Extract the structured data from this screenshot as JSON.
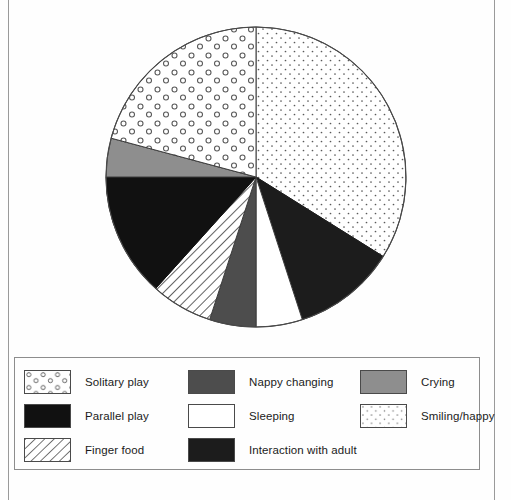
{
  "page": {
    "background": "#fefefe",
    "rule_color": "#9a9a9a"
  },
  "chart_data": {
    "type": "pie",
    "title": "",
    "subtitle": "",
    "xlabel": "",
    "ylabel": "",
    "legend_position": "bottom",
    "grid": false,
    "units": "proportion of observations",
    "start_angle_deg": 0,
    "direction": "clockwise",
    "categories": [
      "Smiling/happy",
      "Interaction with adult",
      "Sleeping",
      "Nappy changing",
      "Finger food",
      "Parallel play",
      "Crying",
      "Solitary play"
    ],
    "values": [
      33.9,
      11.1,
      5.0,
      5.0,
      6.7,
      13.3,
      4.2,
      20.8
    ],
    "slices": [
      {
        "label": "Smiling/happy",
        "value": 33.9,
        "start_deg": 0,
        "end_deg": 122,
        "fill": "#ffffff",
        "pattern": "fine-dots",
        "pattern_color": "#5a5a5a",
        "stroke": "#3c3c3c"
      },
      {
        "label": "Interaction with adult",
        "value": 11.1,
        "start_deg": 122,
        "end_deg": 162,
        "fill": "#1c1c1c",
        "pattern": "solid",
        "pattern_color": "#1c1c1c",
        "stroke": "#1c1c1c"
      },
      {
        "label": "Sleeping",
        "value": 5.0,
        "start_deg": 162,
        "end_deg": 180,
        "fill": "#ffffff",
        "pattern": "solid",
        "pattern_color": "#ffffff",
        "stroke": "#3c3c3c"
      },
      {
        "label": "Nappy changing",
        "value": 5.0,
        "start_deg": 180,
        "end_deg": 198,
        "fill": "#4d4d4d",
        "pattern": "solid",
        "pattern_color": "#4d4d4d",
        "stroke": "#3c3c3c"
      },
      {
        "label": "Finger food",
        "value": 6.7,
        "start_deg": 198,
        "end_deg": 222,
        "fill": "#ffffff",
        "pattern": "diagonal-hatch",
        "pattern_color": "#2e2e2e",
        "stroke": "#3c3c3c"
      },
      {
        "label": "Parallel play",
        "value": 13.3,
        "start_deg": 222,
        "end_deg": 270,
        "fill": "#111111",
        "pattern": "solid",
        "pattern_color": "#111111",
        "stroke": "#111111"
      },
      {
        "label": "Crying",
        "value": 4.2,
        "start_deg": 270,
        "end_deg": 285,
        "fill": "#8e8e8e",
        "pattern": "solid",
        "pattern_color": "#8e8e8e",
        "stroke": "#3c3c3c"
      },
      {
        "label": "Solitary play",
        "value": 20.8,
        "start_deg": 285,
        "end_deg": 360,
        "fill": "#ffffff",
        "pattern": "open-circles",
        "pattern_color": "#5a5a5a",
        "stroke": "#3c3c3c"
      }
    ],
    "geometry": {
      "center_x": 256,
      "center_y": 177,
      "radius": 150,
      "outline_color": "#4a4a4a"
    }
  },
  "legend": {
    "border_color": "#8d8d8d",
    "columns": [
      {
        "items": [
          {
            "label": "Solitary play",
            "swatch": "open-circles"
          },
          {
            "label": "Parallel play",
            "swatch": "solid-black"
          },
          {
            "label": "Finger food",
            "swatch": "diagonal-hatch"
          }
        ]
      },
      {
        "items": [
          {
            "label": "Nappy changing",
            "swatch": "solid-dark-gray"
          },
          {
            "label": "Sleeping",
            "swatch": "solid-white"
          },
          {
            "label": "Interaction with adult",
            "swatch": "solid-near-black"
          }
        ]
      },
      {
        "items": [
          {
            "label": "Crying",
            "swatch": "solid-mid-gray"
          },
          {
            "label": "Smiling/happy",
            "swatch": "fine-dots"
          }
        ]
      }
    ]
  }
}
